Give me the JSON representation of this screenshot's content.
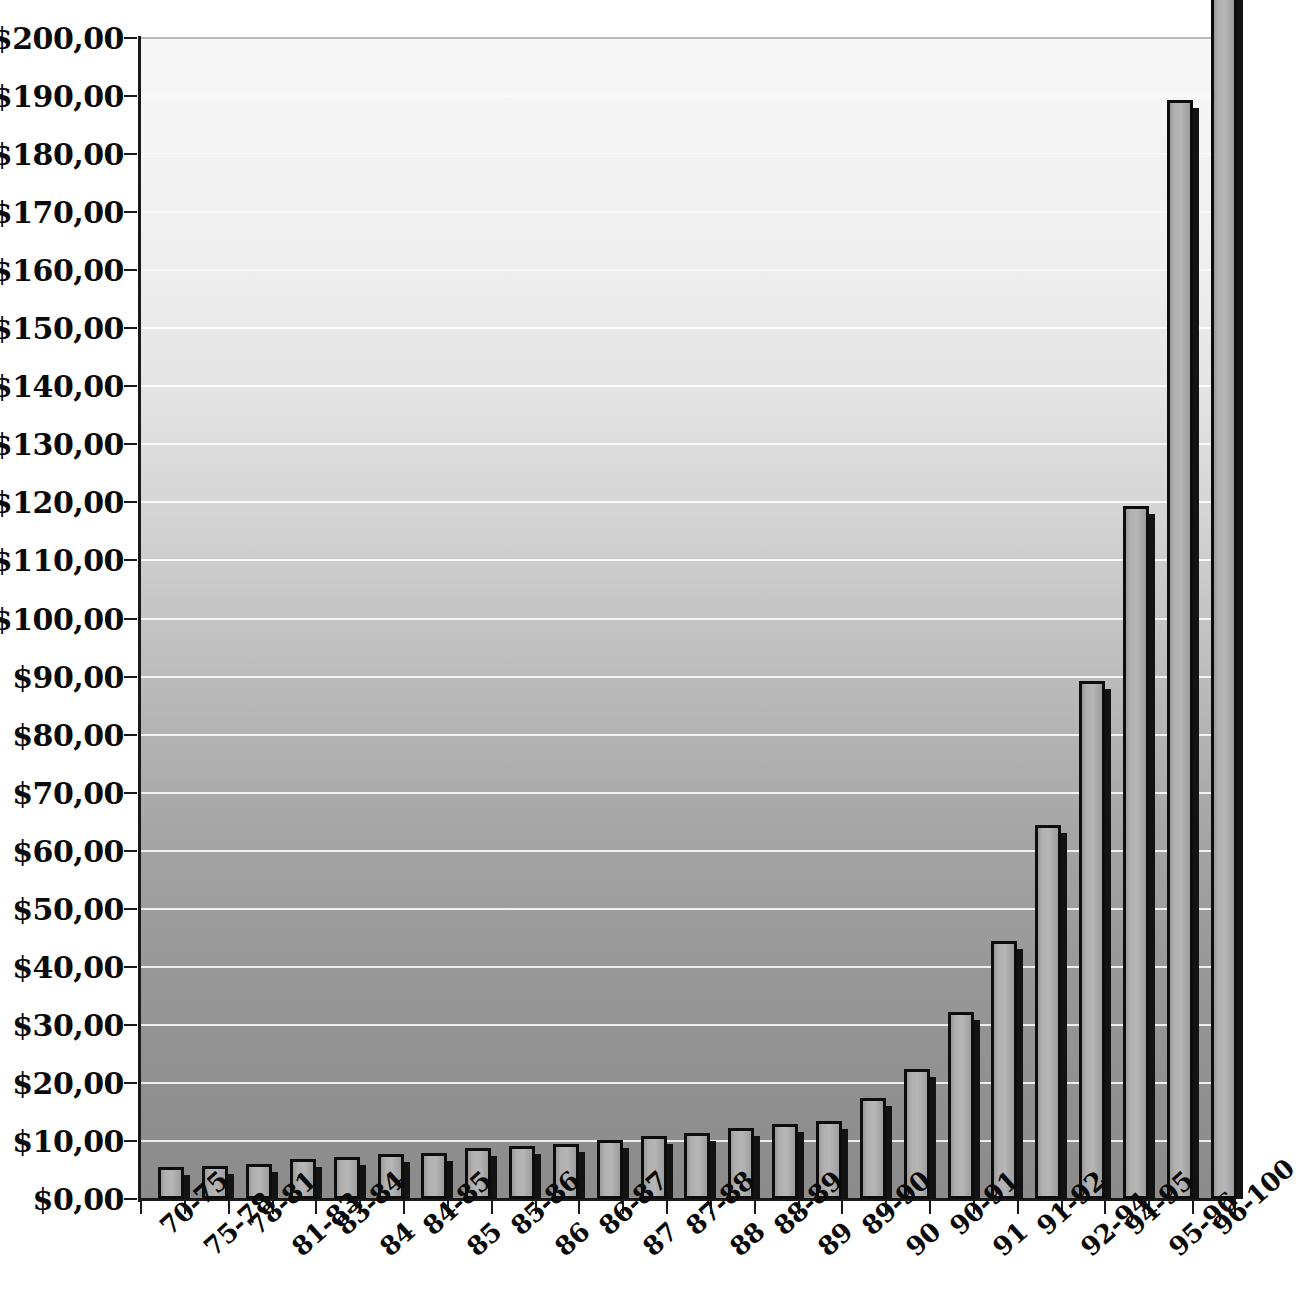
{
  "chart_data": {
    "type": "bar",
    "title": "",
    "subtitle": "",
    "xlabel": "",
    "ylabel": "",
    "ylim": [
      0,
      200
    ],
    "ytick_step": 10,
    "grid": true,
    "legend": null,
    "currency_symbol": "$",
    "decimal_separator": ",",
    "ytick_labels": [
      "$200,00",
      "$190,00",
      "$180,00",
      "$170,00",
      "$160,00",
      "$150,00",
      "$140,00",
      "$130,00",
      "$120,00",
      "$110,00",
      "$100,00",
      "$90,00",
      "$80,00",
      "$70,00",
      "$60,00",
      "$50,00",
      "$40,00",
      "$30,00",
      "$20,00",
      "$10,00",
      "$0,00"
    ],
    "ytick_values": [
      200,
      190,
      180,
      170,
      160,
      150,
      140,
      130,
      120,
      110,
      100,
      90,
      80,
      70,
      60,
      50,
      40,
      30,
      20,
      10,
      0
    ],
    "categories": [
      "70-75",
      "75-78",
      "78-81",
      "81-83",
      "83-84",
      "84",
      "84-85",
      "85",
      "85-86",
      "86",
      "86-87",
      "87",
      "87-88",
      "88",
      "88-89",
      "89",
      "89-90",
      "90",
      "90-91",
      "91",
      "91-92",
      "92-94",
      "94-95",
      "95-96",
      "96-100"
    ],
    "values": [
      5.5,
      5.7,
      6.0,
      6.9,
      7.2,
      7.8,
      8.0,
      8.7,
      9.2,
      9.5,
      10.1,
      10.8,
      11.4,
      12.2,
      13.0,
      13.5,
      17.4,
      22.4,
      32.2,
      44.4,
      64.4,
      89.3,
      119.4,
      189.4,
      215.0
    ],
    "notes": [
      "Last bar (96-100) is clipped at the top of the plot area and exceeds the $200,00 axis maximum."
    ],
    "colors": {
      "bar_fill": "#b3b3b3",
      "bar_outline": "#0d0d0d",
      "bar_shadow": "#131313",
      "gridline": "#ffffff",
      "axis": "#1a1a1a",
      "plot_bg_top": "#f7f7f7",
      "plot_bg_bottom": "#8c8c8c",
      "page_bg": "#ffffff",
      "text": "#0a0a0a"
    }
  }
}
